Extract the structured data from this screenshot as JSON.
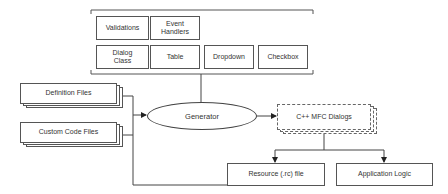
{
  "diagram": {
    "components_group": {
      "row1": [
        "Validations",
        "Event\nHandlers"
      ],
      "row2": [
        "Dialog\nClass",
        "Table",
        "Dropdown",
        "Checkbox"
      ]
    },
    "inputs": {
      "definition_files": "Definition Files",
      "custom_code_files": "Custom Code Files"
    },
    "generator": "Generator",
    "output": "C++ MFC Dialogs",
    "results": {
      "resource_file": "Resource (.rc) file",
      "application_logic": "Application Logic"
    },
    "colors": {
      "line": "#444444",
      "box_border": "#555555",
      "text": "#333333",
      "background": "#ffffff"
    }
  }
}
